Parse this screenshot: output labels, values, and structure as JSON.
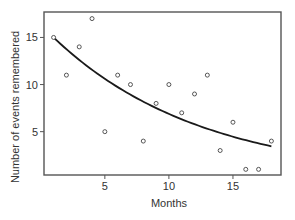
{
  "chart_data": {
    "type": "scatter",
    "title": "",
    "xlabel": "Months",
    "ylabel": "Number of events remembered",
    "xlim": [
      0.25,
      18.75
    ],
    "ylim": [
      0.4,
      17.7
    ],
    "xticks": [
      5,
      10,
      15
    ],
    "yticks": [
      5,
      10,
      15
    ],
    "xtick_labels": [
      "5",
      "10",
      "15"
    ],
    "ytick_labels": [
      "5",
      "10",
      "15"
    ],
    "grid": false,
    "legend": null,
    "series": [
      {
        "name": "observations",
        "kind": "scatter",
        "marker": "open-circle",
        "points": [
          {
            "x": 1,
            "y": 15
          },
          {
            "x": 2,
            "y": 11
          },
          {
            "x": 3,
            "y": 14
          },
          {
            "x": 4,
            "y": 17
          },
          {
            "x": 5,
            "y": 5
          },
          {
            "x": 6,
            "y": 11
          },
          {
            "x": 7,
            "y": 10
          },
          {
            "x": 8,
            "y": 4
          },
          {
            "x": 9,
            "y": 8
          },
          {
            "x": 10,
            "y": 10
          },
          {
            "x": 11,
            "y": 7
          },
          {
            "x": 12,
            "y": 9
          },
          {
            "x": 13,
            "y": 11
          },
          {
            "x": 14,
            "y": 3
          },
          {
            "x": 15,
            "y": 6
          },
          {
            "x": 16,
            "y": 1
          },
          {
            "x": 17,
            "y": 1
          },
          {
            "x": 18,
            "y": 4
          }
        ]
      },
      {
        "name": "fitted curve",
        "kind": "line",
        "model": "exponential decay",
        "a": 16.35,
        "b": 0.0865,
        "x_range": [
          1,
          18
        ],
        "approx_points": [
          {
            "x": 1,
            "y": 15.0
          },
          {
            "x": 5,
            "y": 10.6
          },
          {
            "x": 10,
            "y": 6.9
          },
          {
            "x": 15,
            "y": 4.5
          },
          {
            "x": 18,
            "y": 3.45
          }
        ]
      }
    ],
    "colors": {
      "axis": "#555555",
      "line": "#1a1a1a",
      "marker": "#444444",
      "text": "#333333"
    }
  }
}
